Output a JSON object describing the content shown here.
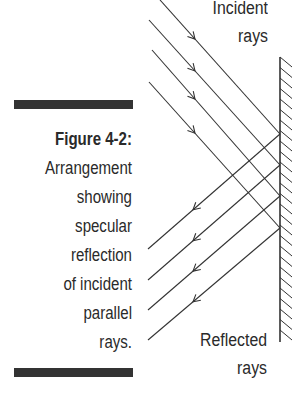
{
  "figure": {
    "number_label": "Figure 4-2:",
    "caption_lines": [
      "Arrangement",
      "showing",
      "specular",
      "reflection",
      "of incident",
      "parallel",
      "rays."
    ]
  },
  "labels": {
    "incident": [
      "Incident",
      "rays"
    ],
    "reflected": [
      "Reflected",
      "rays"
    ]
  },
  "diagram": {
    "mirror": {
      "x": 280,
      "y1": 57,
      "y2": 342
    },
    "incident_rays": [
      {
        "x1": 160,
        "y1": 0,
        "x2": 280,
        "y2": 134
      },
      {
        "x1": 149,
        "y1": 20,
        "x2": 280,
        "y2": 165
      },
      {
        "x1": 152,
        "y1": 50,
        "x2": 280,
        "y2": 196
      },
      {
        "x1": 149,
        "y1": 82,
        "x2": 280,
        "y2": 228
      }
    ],
    "reflected_rays": [
      {
        "x1": 280,
        "y1": 134,
        "x2": 148,
        "y2": 249
      },
      {
        "x1": 280,
        "y1": 165,
        "x2": 148,
        "y2": 280
      },
      {
        "x1": 280,
        "y1": 196,
        "x2": 148,
        "y2": 310
      },
      {
        "x1": 280,
        "y1": 228,
        "x2": 148,
        "y2": 340
      }
    ],
    "line_color": "#333333"
  }
}
